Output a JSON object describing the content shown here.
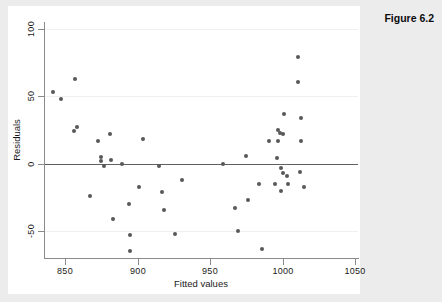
{
  "caption": "Figure 6.2",
  "chart_data": {
    "type": "scatter",
    "title": "",
    "xlabel": "Fitted values",
    "ylabel": "Residuals",
    "xlim": [
      841,
      1057
    ],
    "ylim": [
      -70,
      105
    ],
    "xticks": [
      850,
      900,
      950,
      1000,
      1050
    ],
    "yticks": [
      100,
      50,
      0,
      -50
    ],
    "xticklabels": [
      "850",
      "900",
      "950",
      "1000",
      "1050"
    ],
    "yticklabels": [
      "100",
      "50",
      "0",
      "-50"
    ],
    "grid": "horizontal-major",
    "legend": "none",
    "reference_line": {
      "axis": "y",
      "value": 0
    },
    "marker_color": "#585858",
    "points": [
      {
        "x": 842,
        "y": 53
      },
      {
        "x": 847,
        "y": 48
      },
      {
        "x": 857,
        "y": 63
      },
      {
        "x": 856,
        "y": 24
      },
      {
        "x": 858,
        "y": 27
      },
      {
        "x": 867,
        "y": -24
      },
      {
        "x": 873,
        "y": 17
      },
      {
        "x": 875,
        "y": 5
      },
      {
        "x": 875,
        "y": 2
      },
      {
        "x": 877,
        "y": -2
      },
      {
        "x": 881,
        "y": 22
      },
      {
        "x": 882,
        "y": 3
      },
      {
        "x": 883,
        "y": -41
      },
      {
        "x": 889,
        "y": 0
      },
      {
        "x": 894,
        "y": -30
      },
      {
        "x": 895,
        "y": -53
      },
      {
        "x": 895,
        "y": -65
      },
      {
        "x": 901,
        "y": -17
      },
      {
        "x": 904,
        "y": 18
      },
      {
        "x": 915,
        "y": -2
      },
      {
        "x": 917,
        "y": -21
      },
      {
        "x": 918,
        "y": -34
      },
      {
        "x": 926,
        "y": -52
      },
      {
        "x": 931,
        "y": -12
      },
      {
        "x": 959,
        "y": 0
      },
      {
        "x": 967,
        "y": -33
      },
      {
        "x": 969,
        "y": -50
      },
      {
        "x": 975,
        "y": 6
      },
      {
        "x": 976,
        "y": -27
      },
      {
        "x": 984,
        "y": -15
      },
      {
        "x": 986,
        "y": -63
      },
      {
        "x": 991,
        "y": 17
      },
      {
        "x": 995,
        "y": -15
      },
      {
        "x": 996,
        "y": 4
      },
      {
        "x": 997,
        "y": 25
      },
      {
        "x": 997,
        "y": 17
      },
      {
        "x": 998,
        "y": 23
      },
      {
        "x": 999,
        "y": -3
      },
      {
        "x": 999,
        "y": -20
      },
      {
        "x": 1000,
        "y": 22
      },
      {
        "x": 1000,
        "y": -7
      },
      {
        "x": 1001,
        "y": 37
      },
      {
        "x": 1003,
        "y": -9
      },
      {
        "x": 1004,
        "y": -15
      },
      {
        "x": 1011,
        "y": 79
      },
      {
        "x": 1011,
        "y": 61
      },
      {
        "x": 1012,
        "y": -6
      },
      {
        "x": 1013,
        "y": 34
      },
      {
        "x": 1013,
        "y": 17
      },
      {
        "x": 1015,
        "y": -17
      }
    ]
  }
}
